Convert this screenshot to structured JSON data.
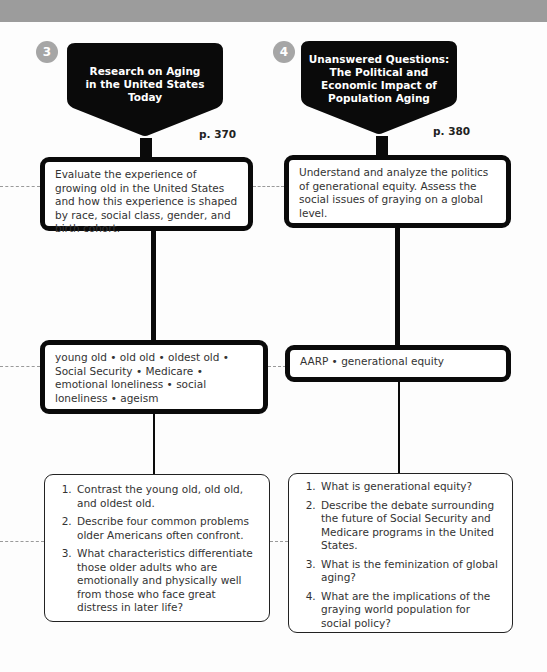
{
  "columns": [
    {
      "number": "3",
      "title": "Research on Aging in the United States Today",
      "title_lines": [
        "Research on Aging",
        "in the United States",
        "Today"
      ],
      "page": "p. 370",
      "objective": "Evaluate the experience of growing old in the United States and how this experience is shaped by race, social class, gender, and birth cohort.",
      "key_terms": "young old • old old • oldest old • Social Security • Medicare • emotional loneliness • social loneliness • ageism",
      "questions": [
        "Contrast the young old, old old, and oldest old.",
        "Describe four common problems older Americans often confront.",
        "What characteristics differentiate those older adults who are emotionally and physically well from those who face great distress in later life?"
      ]
    },
    {
      "number": "4",
      "title": "Unanswered Questions: The Political and Economic Impact of Population Aging",
      "title_lines": [
        "Unanswered Questions:",
        "The Political and",
        "Economic Impact of",
        "Population Aging"
      ],
      "page": "p. 380",
      "objective": "Understand and analyze the politics of generational equity. Assess the social issues of graying on a global level.",
      "key_terms": "AARP • generational equity",
      "questions": [
        "What is generational equity?",
        "Describe the debate surrounding the future of Social Security and Medicare programs in the United States.",
        "What is the feminization of global aging?",
        "What are the implications of the graying world population for social policy?"
      ]
    }
  ],
  "colors": {
    "band": "#9c9c9c",
    "badge": "#a6a6a6",
    "banner": "#0a0a0a",
    "dash": "#9a9a9a"
  }
}
